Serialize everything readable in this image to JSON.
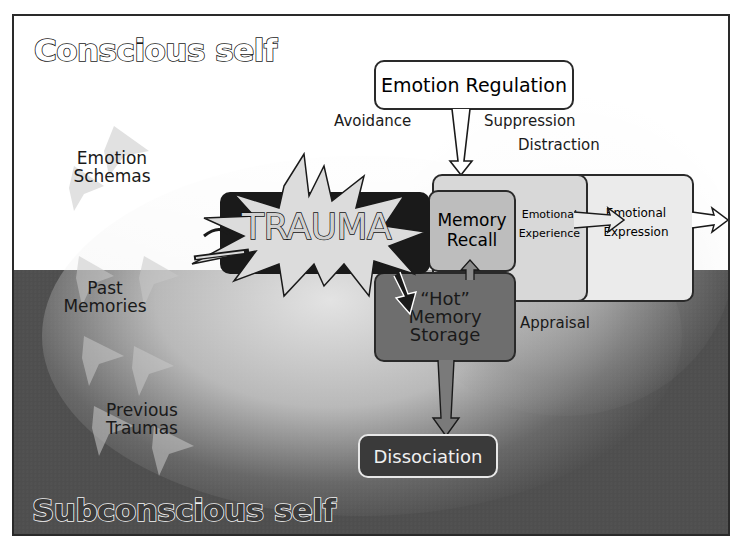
{
  "diagram": {
    "regions": {
      "conscious": "Conscious self",
      "subconscious": "Subconscious self"
    },
    "left_labels": {
      "emotion_schemas": [
        "Emotion",
        "Schemas"
      ],
      "past_memories": [
        "Past",
        "Memories"
      ],
      "previous_traumas": [
        "Previous",
        "Traumas"
      ]
    },
    "regulation": {
      "title": "Emotion Regulation",
      "strategies": {
        "avoidance": "Avoidance",
        "suppression": "Suppression",
        "distraction": "Distraction"
      }
    },
    "trauma": "TRAUMA",
    "memory_recall": [
      "Memory",
      "Recall"
    ],
    "emotional_experience": [
      "Emotional",
      "Experience"
    ],
    "emotional_expression": [
      "Emotional",
      "Expression"
    ],
    "hot_memory": [
      "“Hot”",
      "Memory",
      "Storage"
    ],
    "appraisal": "Appraisal",
    "dissociation": "Dissociation",
    "colors": {
      "top_background": "#ffffff",
      "bottom_background": "#4e4e4e",
      "memory_recall_fill": "#bdbdbd",
      "experience_fill": "#d9d9d9",
      "expression_fill": "#e9e9e9",
      "hot_memory_fill": "#6e6e6e",
      "dissociation_fill": "#3a3a3a",
      "trauma_fill": "#1a1a1a",
      "outline": "#2a2a2a"
    }
  }
}
